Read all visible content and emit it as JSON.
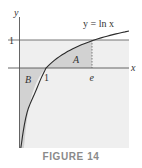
{
  "figure": {
    "caption": "FIGURE 14",
    "axes": {
      "x_label": "x",
      "y_label": "y"
    },
    "curve_label": "y = ln x",
    "curve_label_parts": {
      "lhs": "y",
      "eq": " = ",
      "fn": "ln ",
      "arg": "x"
    },
    "ticks": {
      "x": [
        {
          "label": "1",
          "value": 1
        },
        {
          "label": "e",
          "value": 2.718
        }
      ],
      "y": [
        {
          "label": "1",
          "value": 1
        }
      ]
    },
    "regions": [
      {
        "label": "A",
        "description": "area between y = ln x and x-axis from x=1 to x=e"
      },
      {
        "label": "B",
        "description": "area between y-axis, x-axis and y = ln x for 0 < x < 1"
      }
    ],
    "colors": {
      "background_shade": "#efefef",
      "region_shade": "#d4d4d4",
      "line": "#555555",
      "curve": "#2b2b2b",
      "caption": "#8a8a8a"
    }
  }
}
